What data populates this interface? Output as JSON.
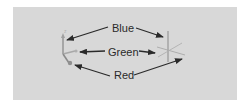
{
  "diagram": {
    "labels": {
      "blue": "Blue",
      "green": "Green",
      "red": "Red"
    },
    "colors": {
      "background": "#ffffff",
      "panel": "#d8d8d8",
      "text": "#2a2a2a",
      "arrow": "#2a2a2a",
      "gizmo": "#9a9a9a"
    },
    "elements": {
      "left": "axis-gizmo",
      "right": "axis-crosshair"
    }
  }
}
